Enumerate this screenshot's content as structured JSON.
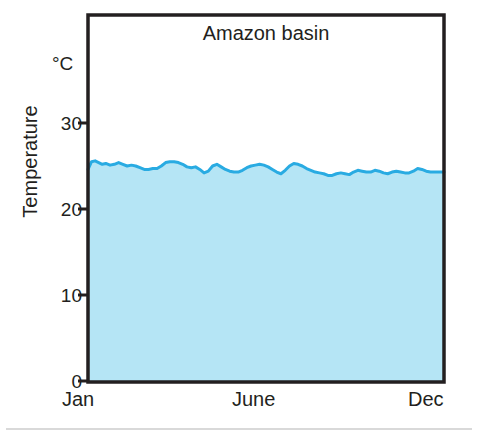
{
  "chart_data": {
    "type": "area",
    "title": "Amazon basin",
    "xlabel": "",
    "ylabel": "Temperature",
    "unit": "°C",
    "ylim": [
      0,
      35
    ],
    "yticks": [
      0,
      10,
      20,
      30
    ],
    "ytick_labels": [
      "0",
      "10",
      "20",
      "30"
    ],
    "xtick_labels": [
      "Jan",
      "June",
      "Dec"
    ],
    "xtick_positions": [
      0,
      0.5,
      1
    ],
    "grid": false,
    "legend": null,
    "series_name": "Mean temperature",
    "x": [
      0.0,
      0.01,
      0.02,
      0.03,
      0.04,
      0.05,
      0.062,
      0.074,
      0.086,
      0.098,
      0.11,
      0.122,
      0.134,
      0.146,
      0.158,
      0.17,
      0.182,
      0.194,
      0.206,
      0.218,
      0.23,
      0.242,
      0.254,
      0.266,
      0.278,
      0.29,
      0.302,
      0.314,
      0.326,
      0.338,
      0.35,
      0.362,
      0.374,
      0.386,
      0.398,
      0.41,
      0.422,
      0.434,
      0.446,
      0.458,
      0.47,
      0.482,
      0.494,
      0.506,
      0.518,
      0.53,
      0.542,
      0.554,
      0.566,
      0.578,
      0.59,
      0.602,
      0.614,
      0.626,
      0.638,
      0.65,
      0.662,
      0.674,
      0.686,
      0.698,
      0.71,
      0.722,
      0.734,
      0.746,
      0.758,
      0.77,
      0.782,
      0.794,
      0.806,
      0.818,
      0.83,
      0.842,
      0.854,
      0.866,
      0.878,
      0.89,
      0.902,
      0.914,
      0.926,
      0.938,
      0.95,
      0.962,
      0.974,
      0.986,
      1.0
    ],
    "values": [
      24.6,
      25.5,
      25.6,
      25.4,
      25.2,
      25.3,
      25.1,
      25.2,
      25.4,
      25.2,
      25.0,
      25.1,
      25.0,
      24.8,
      24.6,
      24.6,
      24.7,
      24.7,
      25.0,
      25.4,
      25.5,
      25.5,
      25.4,
      25.2,
      24.9,
      24.8,
      24.9,
      24.6,
      24.2,
      24.4,
      25.0,
      25.2,
      24.9,
      24.6,
      24.4,
      24.3,
      24.3,
      24.5,
      24.8,
      25.0,
      25.1,
      25.2,
      25.1,
      24.9,
      24.6,
      24.3,
      24.1,
      24.5,
      25.0,
      25.3,
      25.2,
      25.0,
      24.7,
      24.5,
      24.3,
      24.2,
      24.1,
      23.9,
      23.9,
      24.1,
      24.2,
      24.1,
      24.0,
      24.3,
      24.5,
      24.4,
      24.3,
      24.3,
      24.5,
      24.4,
      24.2,
      24.1,
      24.3,
      24.4,
      24.3,
      24.2,
      24.2,
      24.4,
      24.7,
      24.6,
      24.4,
      24.3,
      24.3,
      24.3,
      24.3
    ],
    "line_color": "#29abe2",
    "fill_color": "#b5e5f5",
    "axis_color": "#231f20",
    "text_color": "#231f20"
  },
  "axes": {
    "y_unit_label": "°C",
    "y_axis_title": "Temperature"
  },
  "figure": {
    "title": "Amazon basin"
  }
}
